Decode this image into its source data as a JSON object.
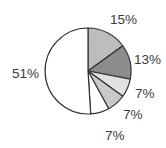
{
  "chart_data": {
    "type": "pie",
    "title": "",
    "start_angle_deg": 90,
    "direction": "clockwise",
    "center": [
      88,
      71
    ],
    "radius": 43,
    "slices": [
      {
        "label": "15%",
        "value": 15,
        "color": "#bdbdbd",
        "label_pos": [
          110,
          24
        ]
      },
      {
        "label": "13%",
        "value": 13,
        "color": "#8c8c8c",
        "label_pos": [
          134,
          64
        ]
      },
      {
        "label": "7%",
        "value": 7,
        "color": "#e2e2e2",
        "label_pos": [
          135,
          98
        ]
      },
      {
        "label": "7%",
        "value": 7,
        "color": "#c9c9c9",
        "label_pos": [
          123,
          119
        ]
      },
      {
        "label": "7%",
        "value": 7,
        "color": "#ffffff",
        "label_pos": [
          105,
          140
        ]
      },
      {
        "label": "51%",
        "value": 51,
        "color": "#ffffff",
        "label_pos": [
          12,
          78
        ]
      }
    ],
    "stroke": "#333333",
    "legend": null
  }
}
